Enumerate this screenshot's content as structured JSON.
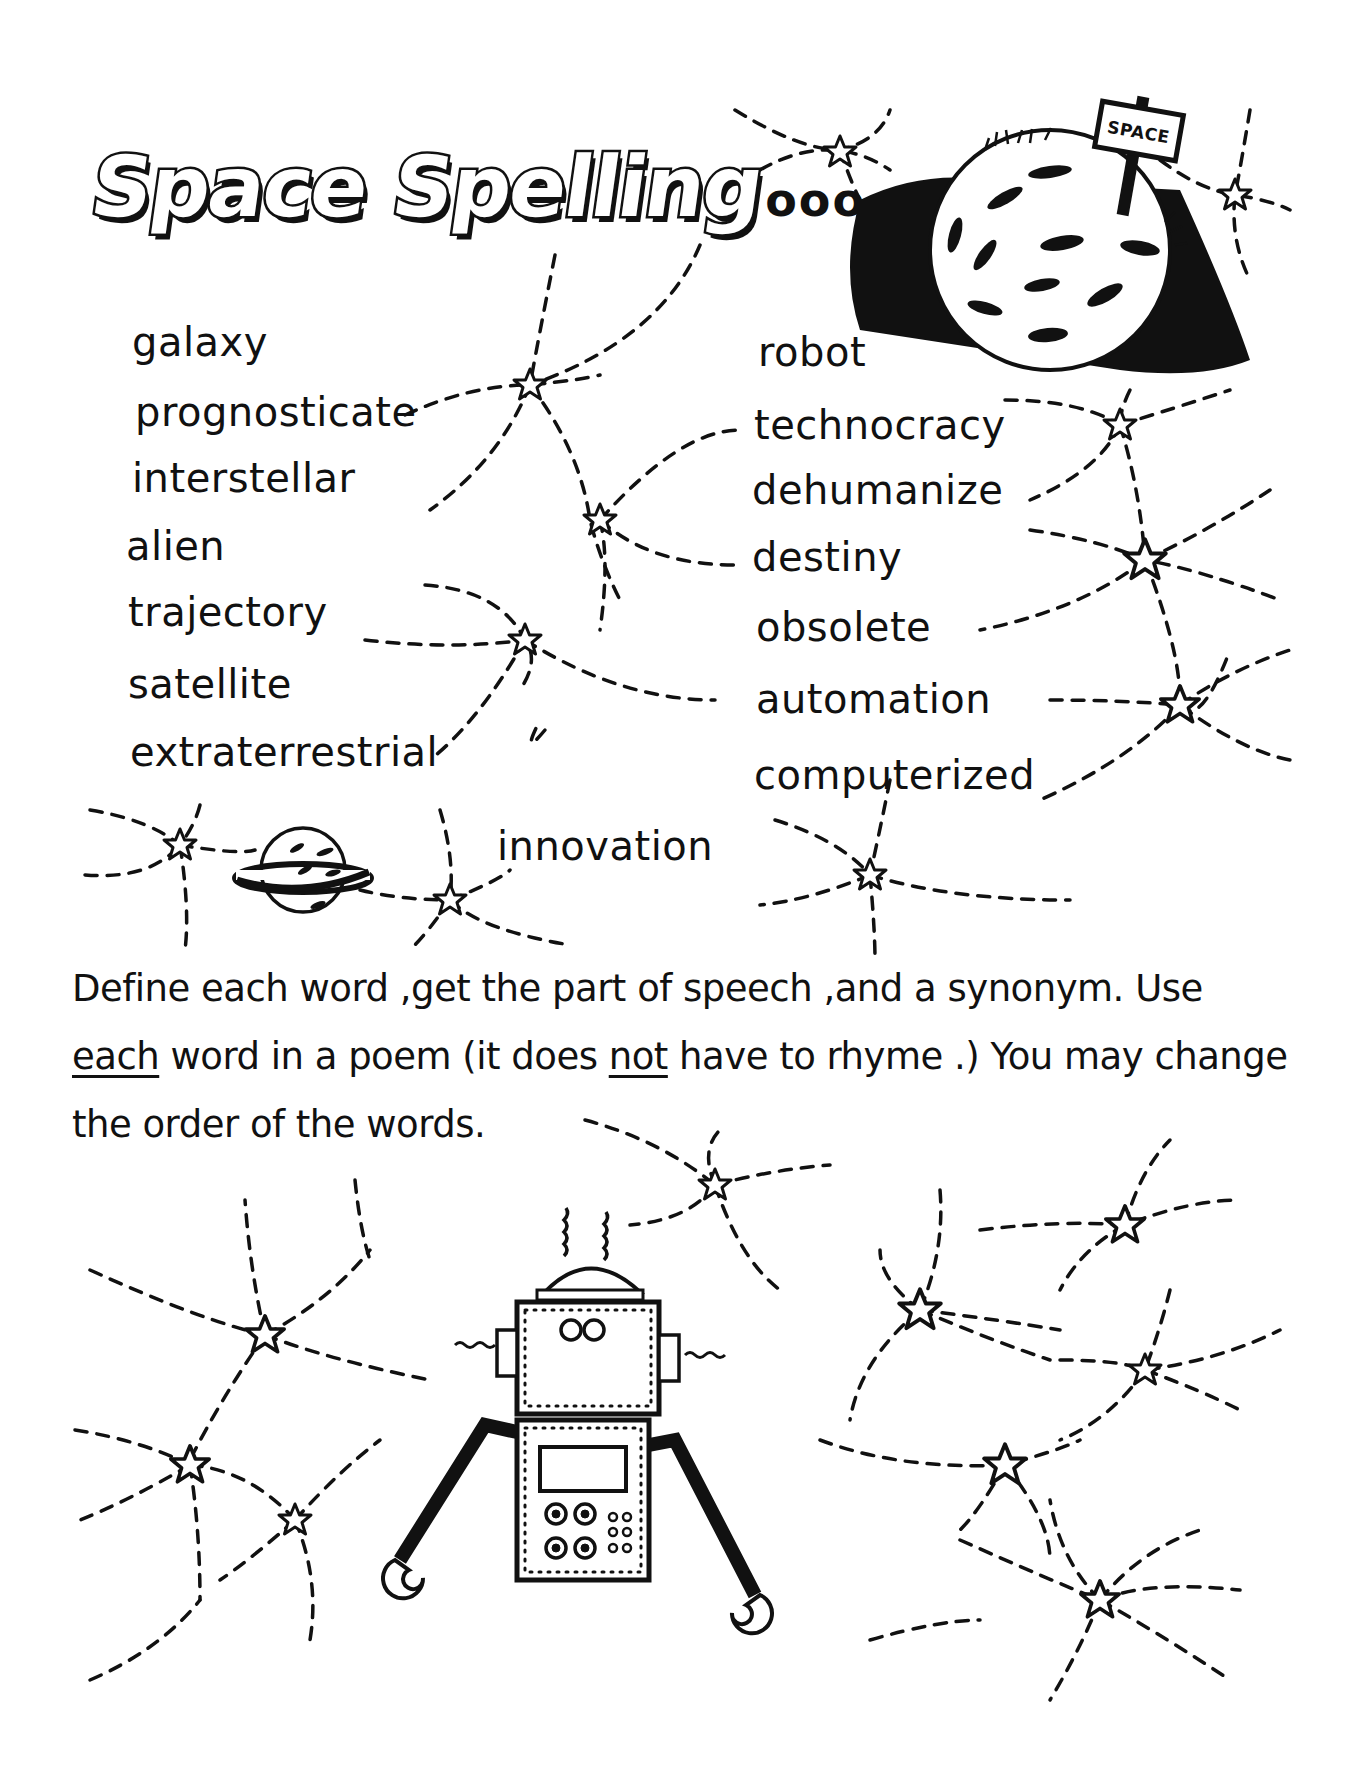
{
  "worksheet": {
    "title": "Space Spelling",
    "title_ellipsis": "ooo",
    "sign_label": "SPACE",
    "word_list": {
      "left_column": [
        "galaxy",
        "prognosticate",
        "interstellar",
        "alien",
        "trajectory",
        "satellite",
        "extraterrestrial"
      ],
      "right_column": [
        "robot",
        "technocracy",
        "dehumanize",
        "destiny",
        "obsolete",
        "automation",
        "computerized"
      ],
      "extra_word": "innovation"
    },
    "instructions": {
      "line1": "Define each word ,get the part of speech ,and a synonym. Use",
      "line2_part1": "each",
      "line2_part2": " word in a poem (it does ",
      "line2_part3": "not",
      "line2_part4": "  have to rhyme .) You may change",
      "line3": "the order of the words."
    },
    "illustrations": [
      "moon-with-sign",
      "ringed-planet",
      "robot",
      "stars",
      "dashed-orbit-lines"
    ],
    "colors": {
      "ink": "#111111",
      "paper": "#ffffff"
    }
  }
}
